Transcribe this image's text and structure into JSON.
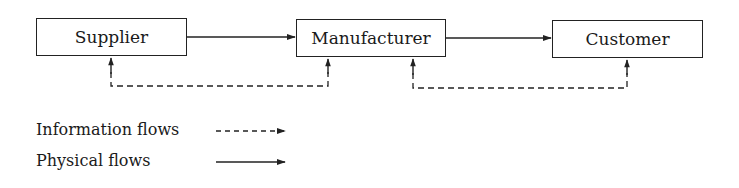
{
  "diagram": {
    "nodes": [
      {
        "id": "supplier",
        "label": "Supplier"
      },
      {
        "id": "manufacturer",
        "label": "Manufacturer"
      },
      {
        "id": "customer",
        "label": "Customer"
      }
    ],
    "edges": [
      {
        "from": "supplier",
        "to": "manufacturer",
        "type": "physical"
      },
      {
        "from": "manufacturer",
        "to": "customer",
        "type": "physical"
      },
      {
        "between": [
          "supplier",
          "manufacturer"
        ],
        "type": "information",
        "direction": "both"
      },
      {
        "between": [
          "manufacturer",
          "customer"
        ],
        "type": "information",
        "direction": "both"
      }
    ]
  },
  "legend": {
    "information": "Information flows",
    "physical": "Physical flows"
  },
  "colors": {
    "line": "#222222",
    "background": "#ffffff"
  }
}
